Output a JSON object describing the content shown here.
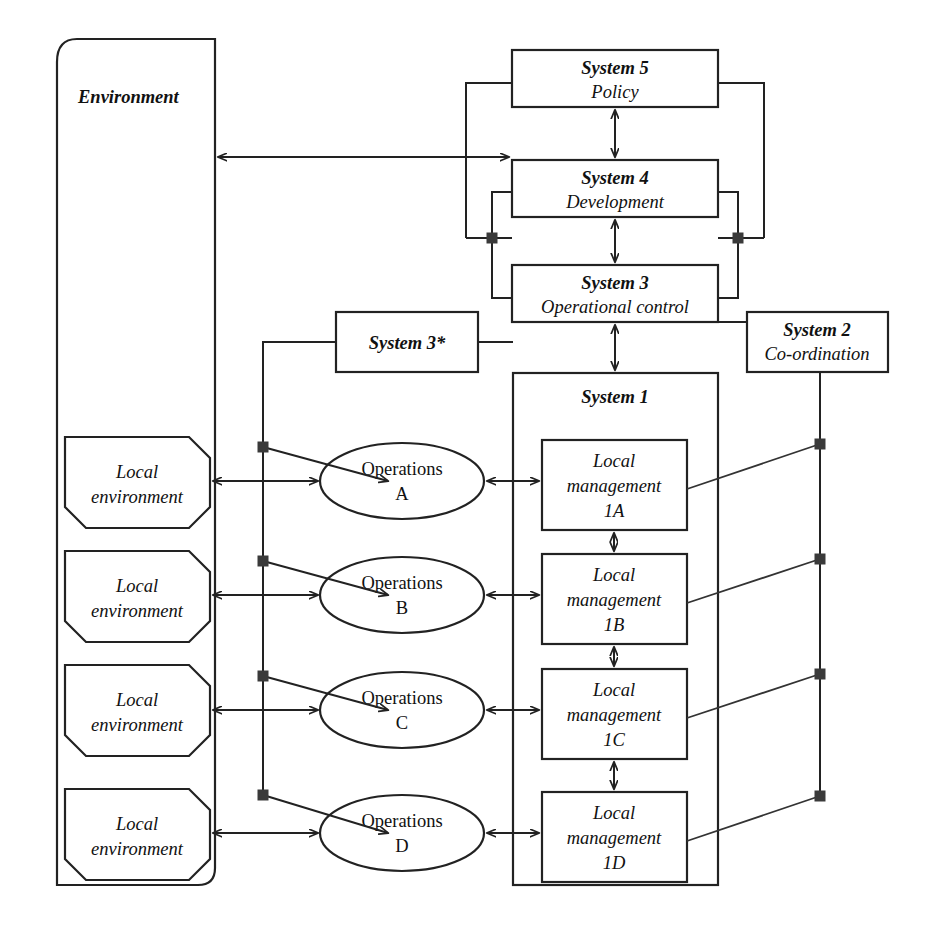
{
  "diagram": {
    "type": "vsm-diagram",
    "colors": {
      "line": "#222222",
      "fill": "#ffffff",
      "dot": "#3a3a3a",
      "text": "#111111"
    }
  },
  "environment": {
    "label": "Environment"
  },
  "systems": {
    "system5": {
      "line1": "System 5",
      "line2": "Policy"
    },
    "system4": {
      "line1": "System 4",
      "line2": "Development"
    },
    "system3": {
      "line1": "System 3",
      "line2": "Operational control"
    },
    "system3star": {
      "line1": "System 3*"
    },
    "system2": {
      "line1": "System 2",
      "line2": "Co-ordination"
    },
    "system1": {
      "line1": "System 1"
    }
  },
  "units": [
    {
      "local_environment": {
        "line1": "Local",
        "line2": "environment"
      },
      "operations": {
        "line1": "Operations",
        "line2": "A"
      },
      "local_management": {
        "line1": "Local",
        "line2": "management",
        "line3": "1A"
      }
    },
    {
      "local_environment": {
        "line1": "Local",
        "line2": "environment"
      },
      "operations": {
        "line1": "Operations",
        "line2": "B"
      },
      "local_management": {
        "line1": "Local",
        "line2": "management",
        "line3": "1B"
      }
    },
    {
      "local_environment": {
        "line1": "Local",
        "line2": "environment"
      },
      "operations": {
        "line1": "Operations",
        "line2": "C"
      },
      "local_management": {
        "line1": "Local",
        "line2": "management",
        "line3": "1C"
      }
    },
    {
      "local_environment": {
        "line1": "Local",
        "line2": "environment"
      },
      "operations": {
        "line1": "Operations",
        "line2": "D"
      },
      "local_management": {
        "line1": "Local",
        "line2": "management",
        "line3": "1D"
      }
    }
  ]
}
